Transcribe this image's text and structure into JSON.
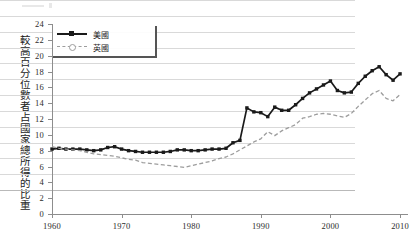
{
  "chart_data": {
    "type": "line",
    "title": "",
    "xlabel": "",
    "ylabel": "較高百分位數者占國家總所得的比重",
    "xlim": [
      1960,
      2011
    ],
    "ylim": [
      0,
      24
    ],
    "yticks": [
      0,
      2,
      4,
      6,
      8,
      10,
      12,
      14,
      16,
      18,
      20,
      22,
      24
    ],
    "ytick_labels": [
      "0",
      "2",
      "4",
      "6",
      "8",
      "10",
      "12",
      "14",
      "16",
      "18",
      "20",
      "22",
      "24"
    ],
    "xticks": [
      1960,
      1970,
      1980,
      1990,
      2000,
      2010
    ],
    "xtick_labels": [
      "1960",
      "1970",
      "1980",
      "1990",
      "2000",
      "2010"
    ],
    "grid": true,
    "legend_position": "top-left",
    "x": [
      1960,
      1961,
      1962,
      1963,
      1964,
      1965,
      1966,
      1967,
      1968,
      1969,
      1970,
      1971,
      1972,
      1973,
      1974,
      1975,
      1976,
      1977,
      1978,
      1979,
      1980,
      1981,
      1982,
      1983,
      1984,
      1985,
      1986,
      1987,
      1988,
      1989,
      1990,
      1991,
      1992,
      1993,
      1994,
      1995,
      1996,
      1997,
      1998,
      1999,
      2000,
      2001,
      2002,
      2003,
      2004,
      2005,
      2006,
      2007,
      2008,
      2009,
      2010
    ],
    "series": [
      {
        "name": "美國",
        "color": "#1a1a1a",
        "style": "solid",
        "marker": "square",
        "values": [
          8.2,
          8.3,
          8.2,
          8.2,
          8.2,
          8.1,
          8.0,
          8.1,
          8.4,
          8.5,
          8.2,
          8.0,
          7.9,
          7.8,
          7.8,
          7.8,
          7.8,
          7.9,
          8.1,
          8.1,
          8.0,
          8.0,
          8.1,
          8.2,
          8.2,
          8.3,
          9.0,
          9.3,
          13.4,
          12.9,
          12.8,
          12.3,
          13.5,
          13.1,
          13.1,
          13.8,
          14.6,
          15.3,
          15.8,
          16.3,
          16.8,
          15.6,
          15.3,
          15.4,
          16.5,
          17.4,
          18.1,
          18.6,
          17.6,
          16.9,
          17.7
        ]
      },
      {
        "name": "英國",
        "color": "#9d9d9d",
        "style": "dashed",
        "marker": "none",
        "values": [
          8.5,
          8.3,
          8.2,
          8.1,
          8.0,
          7.8,
          7.6,
          7.5,
          7.4,
          7.3,
          7.1,
          6.9,
          6.8,
          6.5,
          6.4,
          6.3,
          6.2,
          6.1,
          6.0,
          5.9,
          6.1,
          6.3,
          6.5,
          6.7,
          7.0,
          7.2,
          7.6,
          8.1,
          8.6,
          9.1,
          9.5,
          10.4,
          9.9,
          10.5,
          10.9,
          11.3,
          12.1,
          12.3,
          12.6,
          12.7,
          12.6,
          12.4,
          12.2,
          12.7,
          13.6,
          14.4,
          15.2,
          15.6,
          14.6,
          14.3,
          15.1
        ]
      }
    ]
  },
  "legend": {
    "items": [
      {
        "label": "美國"
      },
      {
        "label": "英國"
      }
    ]
  },
  "colors": {
    "us_line": "#1a1a1a",
    "uk_line": "#9d9d9d",
    "grid": "#d9d9d9",
    "axis": "#8d8d8d",
    "background": "#ffffff"
  }
}
